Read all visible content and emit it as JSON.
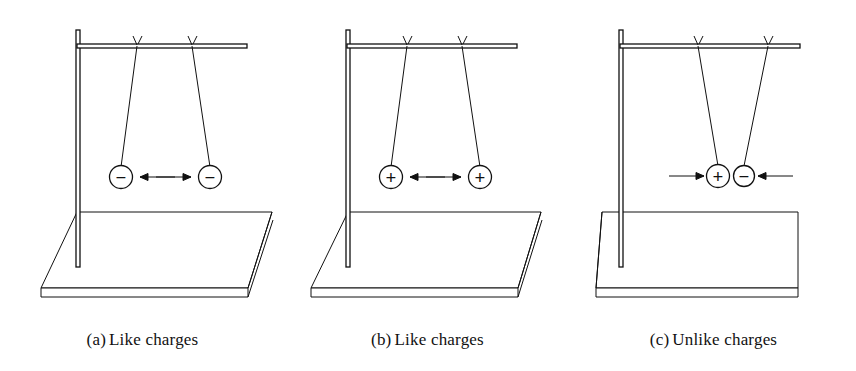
{
  "figure": {
    "background_color": "#ffffff",
    "ink_color": "#111111",
    "panel_count": 3
  },
  "panels": [
    {
      "id": "a",
      "caption_label": "(a)",
      "caption_text": "Like charges",
      "caption_full": "(a) Like charges",
      "interaction": "repulsion",
      "left_charge": "−",
      "right_charge": "−",
      "left_charge_name": "negative",
      "right_charge_name": "negative",
      "left_arrow_direction": "left",
      "right_arrow_direction": "right",
      "charge_separation_px": 89
    },
    {
      "id": "b",
      "caption_label": "(b)",
      "caption_text": "Like charges",
      "caption_full": "(b) Like charges",
      "interaction": "repulsion",
      "left_charge": "+",
      "right_charge": "+",
      "left_charge_name": "positive",
      "right_charge_name": "positive",
      "left_arrow_direction": "left",
      "right_arrow_direction": "right",
      "charge_separation_px": 89
    },
    {
      "id": "c",
      "caption_label": "(c)",
      "caption_text": "Unlike charges",
      "caption_full": "(c) Unlike charges",
      "interaction": "attraction",
      "left_charge": "+",
      "right_charge": "−",
      "left_charge_name": "positive",
      "right_charge_name": "negative",
      "left_arrow_direction": "right",
      "right_arrow_direction": "left",
      "charge_separation_px": 26
    }
  ]
}
